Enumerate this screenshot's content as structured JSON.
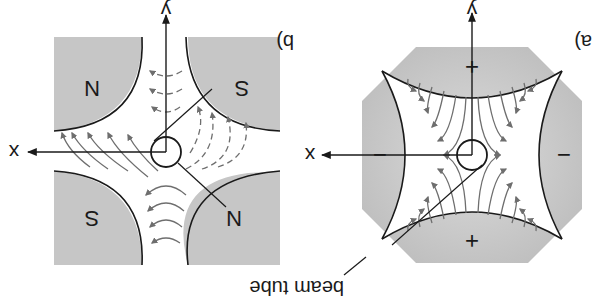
{
  "figure": {
    "orientation": "rotated-180",
    "colors": {
      "pole_fill": "#c8c8c8",
      "pole_edge": "#1a1a1a",
      "field_line": "#6e6e6e",
      "arrow": "#6e6e6e",
      "axis": "#1a1a1a",
      "background": "#ffffff"
    },
    "panel_a": {
      "label": "a)",
      "title": "electric quadrupole",
      "poles": [
        {
          "position": "top",
          "sign": "+"
        },
        {
          "position": "bottom",
          "sign": "+"
        },
        {
          "position": "left",
          "sign": "−"
        },
        {
          "position": "right",
          "sign": "−"
        }
      ],
      "axes": {
        "x": "x",
        "y": "y"
      },
      "beam_tube_label": "beam tube"
    },
    "panel_b": {
      "label": "b)",
      "title": "magnetic quadrupole",
      "poles": [
        {
          "position": "top-left",
          "pole": "N"
        },
        {
          "position": "top-right",
          "pole": "S"
        },
        {
          "position": "bottom-left",
          "pole": "S"
        },
        {
          "position": "bottom-right",
          "pole": "N"
        }
      ],
      "axes": {
        "x": "x",
        "y": "y"
      }
    }
  }
}
